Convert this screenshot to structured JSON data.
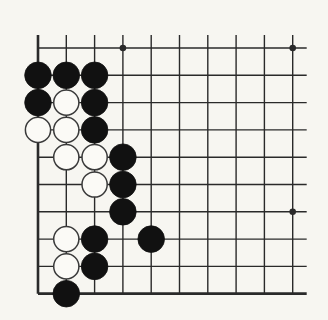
{
  "diagram": {
    "type": "go-board-corner",
    "background": "#f7f6f1",
    "line_color": "#2a2a2a",
    "black_color": "#111111",
    "white_fill": "#fbfaf6",
    "white_stroke": "#3a3a3a",
    "grid": {
      "columns": 10,
      "rows": 10,
      "x0": 38,
      "y0": 48,
      "dx": 28.3,
      "dy": 27.3,
      "top_overhang": 13,
      "right_overhang": 14,
      "edges": [
        "left",
        "bottom"
      ]
    },
    "star_points": [
      {
        "col": 3,
        "row": 0
      },
      {
        "col": 9,
        "row": 0
      },
      {
        "col": 9,
        "row": 6
      }
    ],
    "stones": [
      {
        "color": "black",
        "col": 0,
        "row": 1
      },
      {
        "color": "black",
        "col": 1,
        "row": 1
      },
      {
        "color": "black",
        "col": 2,
        "row": 1
      },
      {
        "color": "black",
        "col": 0,
        "row": 2
      },
      {
        "color": "white",
        "col": 1,
        "row": 2
      },
      {
        "color": "black",
        "col": 2,
        "row": 2
      },
      {
        "color": "white",
        "col": 0,
        "row": 3
      },
      {
        "color": "white",
        "col": 1,
        "row": 3
      },
      {
        "color": "black",
        "col": 2,
        "row": 3
      },
      {
        "color": "white",
        "col": 1,
        "row": 4
      },
      {
        "color": "white",
        "col": 2,
        "row": 4
      },
      {
        "color": "black",
        "col": 3,
        "row": 4
      },
      {
        "color": "white",
        "col": 2,
        "row": 5
      },
      {
        "color": "black",
        "col": 3,
        "row": 5
      },
      {
        "color": "black",
        "col": 3,
        "row": 6
      },
      {
        "color": "white",
        "col": 1,
        "row": 7
      },
      {
        "color": "black",
        "col": 2,
        "row": 7
      },
      {
        "color": "black",
        "col": 4,
        "row": 7
      },
      {
        "color": "white",
        "col": 1,
        "row": 8
      },
      {
        "color": "black",
        "col": 2,
        "row": 8
      },
      {
        "color": "black",
        "col": 1,
        "row": 9
      }
    ]
  }
}
